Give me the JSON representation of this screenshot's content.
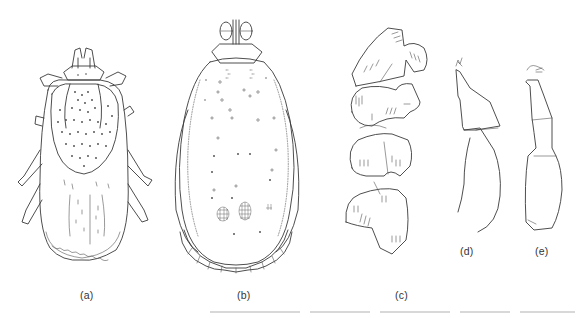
{
  "figure": {
    "panels": [
      {
        "id": "a",
        "label": "(a)",
        "description": "dorsal view of tick (female, scutum with punctations)"
      },
      {
        "id": "b",
        "label": "(b)",
        "description": "dorsal view of engorged tick with festoons"
      },
      {
        "id": "c",
        "label": "(c)",
        "description": "legs / coxae series with setae"
      },
      {
        "id": "d",
        "label": "(d)",
        "description": "palp segment lateral view"
      },
      {
        "id": "e",
        "label": "(e)",
        "description": "palp segment lateral view"
      }
    ],
    "colors": {
      "background": "#ffffff",
      "line": "#3a3a3a"
    }
  }
}
